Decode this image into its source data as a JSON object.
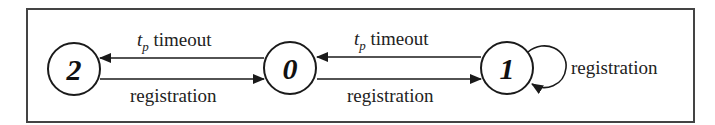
{
  "diagram": {
    "type": "state-transition",
    "colors": {
      "stroke": "#1a1a1a",
      "frame": "#444444",
      "background": "#ffffff"
    },
    "nodes": [
      {
        "id": "2",
        "label": "2"
      },
      {
        "id": "0",
        "label": "0"
      },
      {
        "id": "1",
        "label": "1"
      }
    ],
    "edges": [
      {
        "from": "0",
        "to": "2",
        "label_main": "t",
        "label_sub": "p",
        "label_rest": " timeout"
      },
      {
        "from": "2",
        "to": "0",
        "label": "registration"
      },
      {
        "from": "1",
        "to": "0",
        "label_main": "t",
        "label_sub": "p",
        "label_rest": " timeout"
      },
      {
        "from": "0",
        "to": "1",
        "label": "registration"
      },
      {
        "from": "1",
        "to": "1",
        "label": "registration"
      }
    ]
  }
}
